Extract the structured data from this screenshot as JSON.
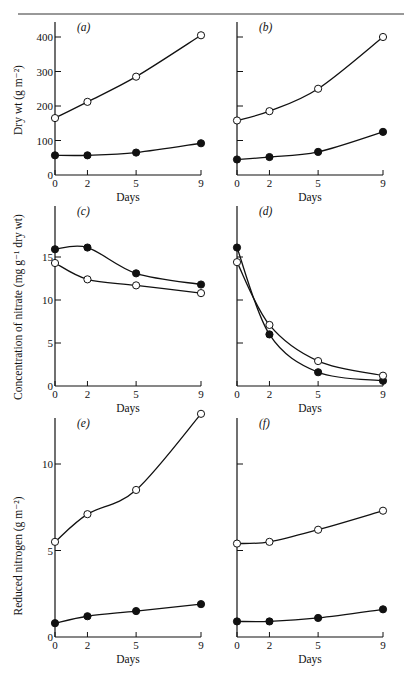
{
  "figure": {
    "x_ticks": [
      "0",
      "2",
      "5",
      "9"
    ],
    "x_label": "Days",
    "y_labels": {
      "dry_wt": "Dry wt  (g m⁻²)",
      "nitrate": "Concentration of nitrate (mg g⁻¹ dry wt)",
      "reduced_n": "Reduced nitrogen (g m⁻²)"
    },
    "panels": {
      "a": "(a)",
      "b": "(b)",
      "c": "(c)",
      "d": "(d)",
      "e": "(e)",
      "f": "(f)"
    },
    "y_ticks": {
      "dry_wt": [
        "0",
        "100",
        "200",
        "300",
        "400"
      ],
      "nitrate": [
        "0",
        "5",
        "10",
        "15"
      ],
      "reduced_n": [
        "0",
        "5",
        "10"
      ]
    }
  },
  "chart_data": [
    {
      "type": "line",
      "panel": "(a)",
      "x": [
        0,
        2,
        5,
        9
      ],
      "xlabel": "Days",
      "ylabel": "Dry wt (g m⁻²)",
      "ylim": [
        0,
        420
      ],
      "series": [
        {
          "name": "open circles",
          "marker": "open",
          "values": [
            165,
            212,
            285,
            405
          ]
        },
        {
          "name": "filled circles",
          "marker": "filled",
          "values": [
            57,
            57,
            65,
            92
          ]
        }
      ]
    },
    {
      "type": "line",
      "panel": "(b)",
      "x": [
        0,
        2,
        5,
        9
      ],
      "xlabel": "Days",
      "ylabel": "Dry wt (g m⁻²)",
      "ylim": [
        0,
        420
      ],
      "series": [
        {
          "name": "open circles",
          "marker": "open",
          "values": [
            158,
            185,
            250,
            400
          ]
        },
        {
          "name": "filled circles",
          "marker": "filled",
          "values": [
            45,
            52,
            67,
            125
          ]
        }
      ]
    },
    {
      "type": "line",
      "panel": "(c)",
      "x": [
        0,
        2,
        5,
        9
      ],
      "xlabel": "Days",
      "ylabel": "Concentration of nitrate (mg g⁻¹ dry wt)",
      "ylim": [
        0,
        20
      ],
      "series": [
        {
          "name": "filled circles",
          "marker": "filled",
          "values": [
            15.9,
            16.1,
            13.1,
            11.8
          ]
        },
        {
          "name": "open circles",
          "marker": "open",
          "values": [
            14.3,
            12.4,
            11.7,
            10.8
          ]
        }
      ]
    },
    {
      "type": "line",
      "panel": "(d)",
      "x": [
        0,
        2,
        5,
        9
      ],
      "xlabel": "Days",
      "ylabel": "Concentration of nitrate (mg g⁻¹ dry wt)",
      "ylim": [
        0,
        20
      ],
      "series": [
        {
          "name": "filled circles",
          "marker": "filled",
          "values": [
            16.1,
            6.0,
            1.6,
            0.6
          ]
        },
        {
          "name": "open circles",
          "marker": "open",
          "values": [
            14.4,
            7.1,
            2.9,
            1.2
          ]
        }
      ]
    },
    {
      "type": "line",
      "panel": "(e)",
      "x": [
        0,
        2,
        5,
        9
      ],
      "xlabel": "Days",
      "ylabel": "Reduced nitrogen (g m⁻²)",
      "ylim": [
        0,
        13
      ],
      "series": [
        {
          "name": "open circles",
          "marker": "open",
          "values": [
            5.5,
            7.1,
            8.5,
            12.9
          ]
        },
        {
          "name": "filled circles",
          "marker": "filled",
          "values": [
            0.8,
            1.2,
            1.5,
            1.9
          ]
        }
      ]
    },
    {
      "type": "line",
      "panel": "(f)",
      "x": [
        0,
        2,
        5,
        9
      ],
      "xlabel": "Days",
      "ylabel": "Reduced nitrogen (g m⁻²)",
      "ylim": [
        0,
        13
      ],
      "series": [
        {
          "name": "open circles",
          "marker": "open",
          "values": [
            5.4,
            5.5,
            6.2,
            7.3
          ]
        },
        {
          "name": "filled circles",
          "marker": "filled",
          "values": [
            0.9,
            0.9,
            1.1,
            1.6
          ]
        }
      ]
    }
  ]
}
